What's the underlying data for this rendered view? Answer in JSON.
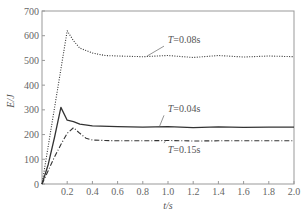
{
  "chart_data": {
    "type": "line",
    "title": "",
    "xlabel": "t/s",
    "ylabel": "E/J",
    "xlim": [
      0,
      2.0
    ],
    "ylim": [
      0,
      700
    ],
    "xticks": [
      "0.2",
      "0.4",
      "0.6",
      "0.8",
      "1.0",
      "1.2",
      "1.4",
      "1.6",
      "1.8",
      "2.0"
    ],
    "yticks": [
      "0",
      "100",
      "200",
      "300",
      "400",
      "500",
      "600",
      "700"
    ],
    "grid": false,
    "legend": "none (inline annotations)",
    "series": [
      {
        "name": "T=0.08s",
        "style": "dotted",
        "x": [
          0,
          0.1,
          0.2,
          0.25,
          0.3,
          0.4,
          0.5,
          0.6,
          0.8,
          1.0,
          1.2,
          1.4,
          1.6,
          1.8,
          2.0
        ],
        "y": [
          0,
          310,
          620,
          580,
          550,
          530,
          520,
          518,
          515,
          520,
          512,
          520,
          514,
          518,
          515
        ]
      },
      {
        "name": "T=0.04s",
        "style": "solid",
        "x": [
          0,
          0.05,
          0.1,
          0.15,
          0.2,
          0.25,
          0.3,
          0.4,
          0.6,
          0.8,
          1.0,
          1.2,
          1.4,
          1.6,
          1.8,
          2.0
        ],
        "y": [
          0,
          80,
          190,
          310,
          258,
          252,
          242,
          235,
          232,
          230,
          232,
          228,
          231,
          229,
          230,
          230
        ]
      },
      {
        "name": "T=0.15s",
        "style": "dash-dot",
        "x": [
          0,
          0.05,
          0.1,
          0.15,
          0.2,
          0.25,
          0.3,
          0.35,
          0.4,
          0.5,
          0.6,
          0.8,
          1.0,
          1.2,
          1.4,
          1.6,
          1.8,
          2.0
        ],
        "y": [
          0,
          55,
          110,
          160,
          205,
          228,
          205,
          185,
          178,
          176,
          175,
          175,
          176,
          174,
          175,
          175,
          175,
          175
        ]
      }
    ],
    "annotations": [
      {
        "text": "T=0.08s",
        "x": 1.0,
        "y": 570,
        "points_to": [
          0.8,
          517
        ]
      },
      {
        "text": "T=0.04s",
        "x": 1.0,
        "y": 290,
        "points_to": [
          0.9,
          232
        ]
      },
      {
        "text": "T=0.15s",
        "x": 1.0,
        "y": 125,
        "points_to": [
          0.95,
          176
        ]
      }
    ]
  },
  "labels": {
    "xlabel": "t/s",
    "ylabel": "E/J",
    "annot_008": "T=0.08s",
    "annot_004": "T=0.04s",
    "annot_015": "T=0.15s"
  },
  "colors": {
    "line": "#333333",
    "axis": "#888888",
    "text": "#555555"
  }
}
